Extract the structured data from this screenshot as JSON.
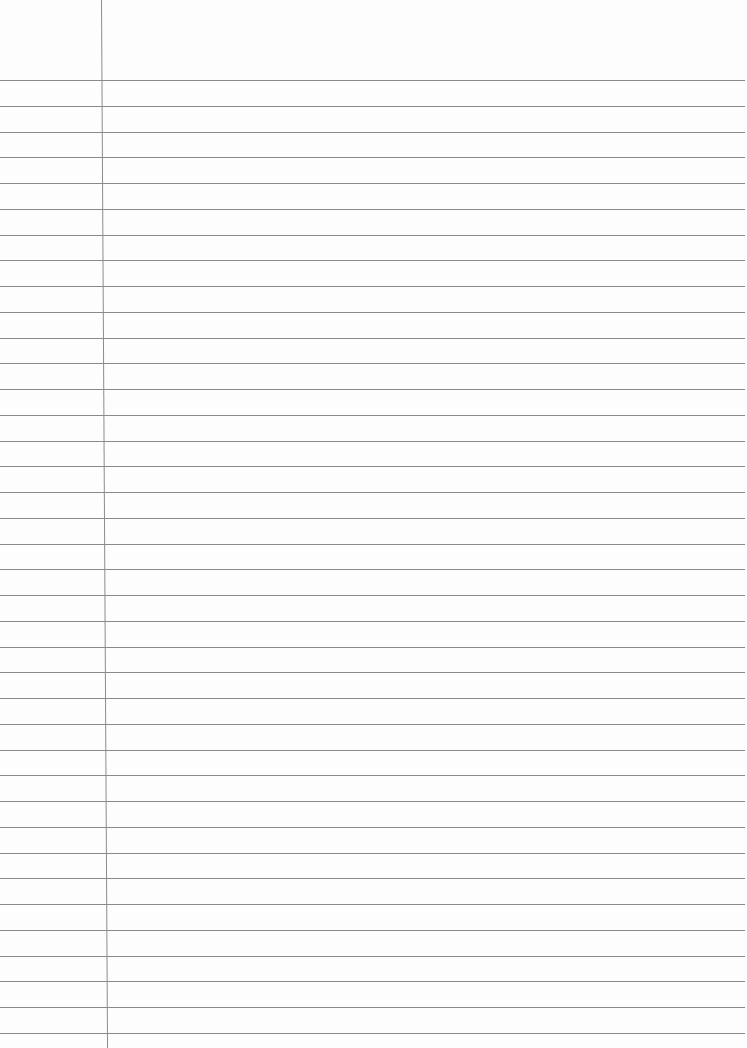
{
  "page": {
    "type": "lined-paper",
    "background_color": "#fdfdfd",
    "rule_color": "#8a8a8a",
    "margin_color": "#8c8c8c",
    "first_rule_y": 80,
    "rule_spacing": 25.75,
    "rule_count": 38,
    "margin_x": 101
  }
}
